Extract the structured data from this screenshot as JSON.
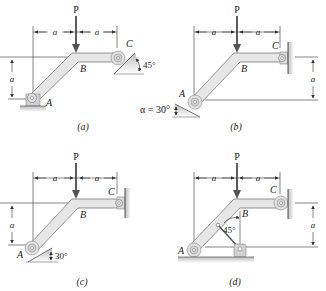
{
  "figure": {
    "panels": [
      {
        "id": "a",
        "caption": "(a)",
        "load_label": "P",
        "dim_a_left": "a",
        "dim_a_right": "a",
        "dim_a_vertical": "a",
        "point_A": "A",
        "point_B": "B",
        "point_C": "C",
        "angle_label": "45°",
        "support_A": "pin",
        "support_C": "roller on 45° incline"
      },
      {
        "id": "b",
        "caption": "(b)",
        "load_label": "P",
        "dim_a_left": "a",
        "dim_a_right": "a",
        "dim_a_vertical": "a",
        "point_A": "A",
        "point_B": "B",
        "point_C": "C",
        "angle_label": "α = 30°",
        "support_A": "roller on 30° incline",
        "support_C": "pin to wall"
      },
      {
        "id": "c",
        "caption": "(c)",
        "load_label": "P",
        "dim_a_left": "a",
        "dim_a_right": "a",
        "dim_a_vertical": "a",
        "point_A": "A",
        "point_B": "B",
        "point_C": "C",
        "angle_label": "30°",
        "support_A": "roller on 30° incline",
        "support_C": "pin to wall"
      },
      {
        "id": "d",
        "caption": "(d)",
        "load_label": "P",
        "dim_a_left": "a",
        "dim_a_right": "a",
        "dim_a_vertical": "a",
        "point_A": "A",
        "point_B": "B",
        "point_C": "C",
        "angle_label": "45°",
        "support_A": "roller on floor",
        "support_C": "roller on wall",
        "link": "two-force link at 45° to pin"
      }
    ],
    "colors": {
      "member_fill": "#e6e6e6",
      "member_stroke": "#7a7a7a",
      "line": "#333333",
      "ground": "#cfcfcf"
    }
  }
}
